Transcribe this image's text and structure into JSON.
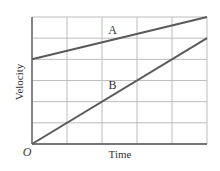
{
  "chart_data": {
    "type": "line",
    "title": "",
    "xlabel": "Time",
    "ylabel": "Velocity",
    "origin_label": "O",
    "grid": true,
    "xlim": [
      0,
      5
    ],
    "ylim": [
      0,
      6
    ],
    "x_gridlines": 5,
    "y_gridlines": 6,
    "series": [
      {
        "name": "A",
        "x": [
          0,
          5
        ],
        "y": [
          4,
          6
        ],
        "label_at": [
          2.3,
          5.2
        ]
      },
      {
        "name": "B",
        "x": [
          0,
          5
        ],
        "y": [
          0,
          5
        ],
        "label_at": [
          2.3,
          2.6
        ]
      }
    ]
  },
  "colors": {
    "grid": "#bdbdbd",
    "axis": "#555555",
    "line": "#5a5a5a",
    "text": "#333333"
  }
}
